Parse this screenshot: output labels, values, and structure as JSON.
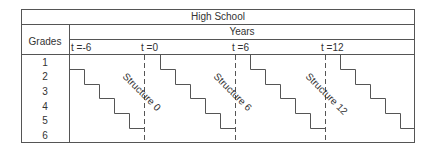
{
  "title": "High School",
  "row_header": "Grades",
  "col_header": "Years",
  "grades": [
    "1",
    "2",
    "3",
    "4",
    "5",
    "6"
  ],
  "time_labels": [
    {
      "label": "t =-6",
      "x": 70
    },
    {
      "label": "t =0",
      "x": 142
    },
    {
      "label": "t =6",
      "x": 233
    },
    {
      "label": "t =12",
      "x": 322
    }
  ],
  "structures": [
    {
      "label": "Structure 0"
    },
    {
      "label": "Structure 6"
    },
    {
      "label": "Structure 12"
    }
  ],
  "colors": {
    "line": "#555555",
    "text": "#333333"
  }
}
